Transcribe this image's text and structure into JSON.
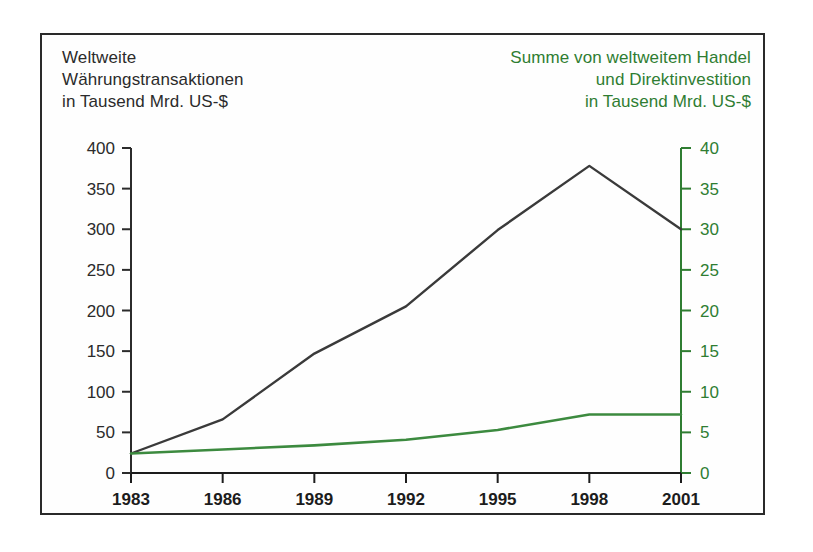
{
  "figure": {
    "background_color": "#ffffff",
    "frame_color": "#2a2a2a",
    "left_series_color": "#3a3a3a",
    "right_series_color": "#3c8a3f",
    "left_axis_color": "#2b2b2b",
    "right_axis_color": "#2f7d32"
  },
  "titles": {
    "left": "Weltweite\nWährungstransaktionen\nin Tausend Mrd. US-$",
    "right": "Summe von weltweitem Handel\nund Direktinvestition\nin Tausend Mrd. US-$"
  },
  "chart_data": {
    "type": "line",
    "title": "Weltweite Währungstransaktionen in Tausend Mrd. US-$",
    "xlabel": "",
    "ylabel": "Weltweite Währungstransaktionen in Tausend Mrd. US-$",
    "y2label": "Summe von weltweitem Handel und Direktinvestition in Tausend Mrd. US-$",
    "grid": false,
    "legend_position": "none",
    "x": [
      1983,
      1986,
      1989,
      1992,
      1995,
      1998,
      2001
    ],
    "xtick_labels": [
      "1983",
      "1986",
      "1989",
      "1992",
      "1995",
      "1998",
      "2001"
    ],
    "xlim": [
      1983,
      2001
    ],
    "ylim": [
      0,
      400
    ],
    "ytick_labels": [
      "0",
      "50",
      "100",
      "150",
      "200",
      "250",
      "300",
      "350",
      "400"
    ],
    "yticks": [
      0,
      50,
      100,
      150,
      200,
      250,
      300,
      350,
      400
    ],
    "y2lim": [
      0,
      40
    ],
    "y2tick_labels": [
      "0",
      "5",
      "10",
      "15",
      "20",
      "25",
      "30",
      "35",
      "40"
    ],
    "y2ticks": [
      0,
      5,
      10,
      15,
      20,
      25,
      30,
      35,
      40
    ],
    "series": [
      {
        "name": "Weltweite Währungstransaktionen",
        "axis": "left",
        "color": "#3a3a3a",
        "values": [
          24,
          66,
          147,
          205,
          299,
          378,
          300
        ]
      },
      {
        "name": "Summe von weltweitem Handel und Direktinvestition",
        "axis": "right",
        "color": "#3c8a3f",
        "values": [
          2.4,
          2.9,
          3.4,
          4.1,
          5.3,
          7.2,
          7.2
        ]
      }
    ]
  }
}
